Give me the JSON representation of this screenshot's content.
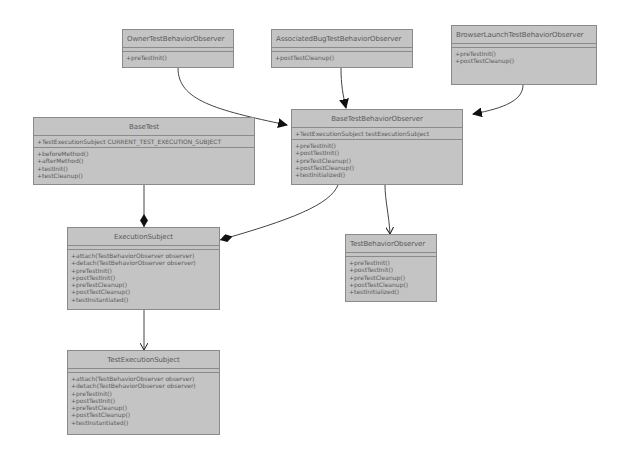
{
  "classes": {
    "owner": {
      "name": "OwnerTestBehaviorObserver",
      "attributes": [],
      "operations": [
        "+preTestInit()"
      ]
    },
    "associated_bug": {
      "name": "AssociatedBugTestBehaviorObserver",
      "attributes": [],
      "operations": [
        "+postTestCleanup()"
      ]
    },
    "browser_launch": {
      "name": "BrowserLaunchTestBehaviorObserver",
      "attributes": [],
      "operations": [
        "+preTestInit()",
        "+postTestCleanup()"
      ]
    },
    "base_test": {
      "name": "BaseTest",
      "attributes": [
        "+TestExecutionSubject CURRENT_TEST_EXECUTION_SUBJECT"
      ],
      "operations": [
        "+beforeMethod()",
        "+afterMethod()",
        "+testInit()",
        "+testCleanup()"
      ]
    },
    "base_test_behavior_observer": {
      "name": "BaseTestBehaviorObserver",
      "attributes": [
        "+TestExecutionSubject testExecutionSubject"
      ],
      "operations": [
        "+preTestInit()",
        "+postTestInit()",
        "+preTestCleanup()",
        "+postTestCleanup()",
        "+testInitialized()"
      ]
    },
    "execution_subject": {
      "name": "ExecutionSubject",
      "attributes": [],
      "operations": [
        "+attach(TestBehaviorObserver observer)",
        "+detach(TestBehaviorObserver observer)",
        "+preTestInit()",
        "+postTestInit()",
        "+preTestCleanup()",
        "+postTestCleanup()",
        "+testInstantiated()"
      ]
    },
    "test_behavior_observer": {
      "name": "TestBehaviorObserver",
      "attributes": [],
      "operations": [
        "+preTestInit()",
        "+postTestInit()",
        "+preTestCleanup()",
        "+postTestCleanup()",
        "+testInitialized()"
      ]
    },
    "test_execution_subject": {
      "name": "TestExecutionSubject",
      "attributes": [],
      "operations": [
        "+attach(TestBehaviorObserver observer)",
        "+detach(TestBehaviorObserver observer)",
        "+preTestInit()",
        "+postTestInit()",
        "+preTestCleanup()",
        "+postTestCleanup()",
        "+testInstantiated()"
      ]
    }
  },
  "relationships": [
    {
      "from": "OwnerTestBehaviorObserver",
      "to": "BaseTestBehaviorObserver",
      "type": "inheritance"
    },
    {
      "from": "AssociatedBugTestBehaviorObserver",
      "to": "BaseTestBehaviorObserver",
      "type": "inheritance"
    },
    {
      "from": "BrowserLaunchTestBehaviorObserver",
      "to": "BaseTestBehaviorObserver",
      "type": "inheritance"
    },
    {
      "from": "BaseTestBehaviorObserver",
      "to": "TestBehaviorObserver",
      "type": "implementation"
    },
    {
      "from": "BaseTestBehaviorObserver",
      "to": "ExecutionSubject",
      "type": "composition"
    },
    {
      "from": "BaseTest",
      "to": "ExecutionSubject",
      "type": "composition"
    },
    {
      "from": "ExecutionSubject",
      "to": "TestExecutionSubject",
      "type": "dependency"
    }
  ],
  "colors": {
    "box_fill": "#c4c4c4",
    "box_border": "#8a8a8a",
    "text": "#5a5a5a",
    "edge": "#333333",
    "background": "#ffffff"
  }
}
